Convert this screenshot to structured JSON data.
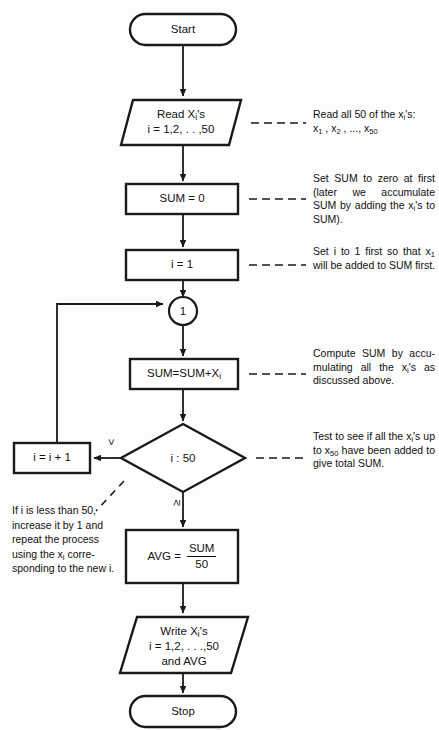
{
  "diagram": {
    "colors": {
      "background": "#fdfdfd",
      "stroke": "#1a1a1a",
      "text": "#111111",
      "shape_fill": "#ffffff"
    }
  },
  "nodes": {
    "start": {
      "label": "Start",
      "shape": "terminator"
    },
    "read": {
      "line1_pre": "Read X",
      "line1_sub": "i",
      "line1_post": "'s",
      "line2": "i = 1,2, . . ,50",
      "shape": "parallelogram"
    },
    "sum_init": {
      "label": "SUM = 0",
      "shape": "process"
    },
    "i_init": {
      "label": "i = 1",
      "shape": "process"
    },
    "connector": {
      "label": "1",
      "shape": "connector"
    },
    "accumulate": {
      "pre": "SUM=SUM+X",
      "sub": "i",
      "shape": "process"
    },
    "decision": {
      "label": "i : 50",
      "shape": "decision"
    },
    "increment": {
      "label": "i = i + 1",
      "shape": "process"
    },
    "average": {
      "lhs": "AVG  =",
      "numerator": "SUM",
      "denominator": "50",
      "shape": "process"
    },
    "write": {
      "line1_pre": "Write X",
      "line1_sub": "i",
      "line1_post": "'s",
      "line2": "i = 1,2, . . .,50",
      "line3": "and AVG",
      "shape": "parallelogram"
    },
    "stop": {
      "label": "Stop",
      "shape": "terminator"
    }
  },
  "branch_labels": {
    "less_than": "<",
    "greater_equal": "≥"
  },
  "annotations": {
    "read_note": {
      "line1_a": "Read all 50 of the x",
      "line1_sub": "i",
      "line1_b": "'s:",
      "line2_parts": [
        "x",
        "1",
        " , x",
        "2",
        " , ..., x",
        "50"
      ]
    },
    "sum_note": {
      "text_a": "Set SUM to zero at first (later we accumulate SUM by adding the x",
      "sub": "i",
      "text_b": "'s to SUM)."
    },
    "i_note": {
      "text_a": "Set i to 1 first so that x",
      "sub": "1",
      "text_b": " will be added to SUM first."
    },
    "accumulate_note": {
      "text_a": "Compute SUM by accu-mulating all the x",
      "sub": "i",
      "text_b": "'s as discussed above."
    },
    "decision_note": {
      "text_a": "Test to see if all the x",
      "sub_a": "i",
      "text_b": "'s up to x",
      "sub_b": "50",
      "text_c": " have been added to give total SUM."
    },
    "increment_note": {
      "text_a": "If i is less than 50, increase it by 1 and repeat the process using the x",
      "sub": "i",
      "text_b": " corre-sponding to the new i."
    }
  }
}
